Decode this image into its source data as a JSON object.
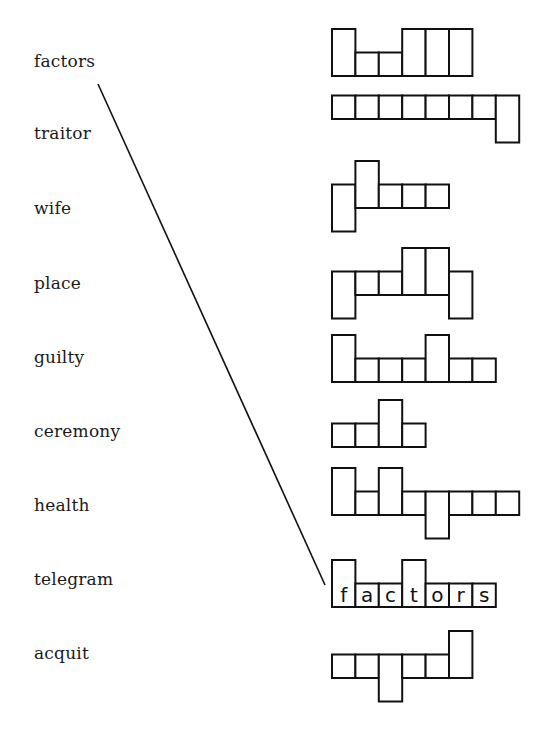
{
  "worksheet": {
    "words": [
      {
        "label": "factors",
        "y": 66
      },
      {
        "label": "traitor",
        "y": 138
      },
      {
        "label": "wife",
        "y": 213
      },
      {
        "label": "place",
        "y": 288
      },
      {
        "label": "guilty",
        "y": 362
      },
      {
        "label": "ceremony",
        "y": 436
      },
      {
        "label": "health",
        "y": 510
      },
      {
        "label": "telegram",
        "y": 584
      },
      {
        "label": "acquit",
        "y": 658
      }
    ],
    "cell_width": 23.4,
    "cell_height": 23.5,
    "shapes_x": 332,
    "shape_rows": [
      {
        "name": "shape-row-1",
        "baseline": 76,
        "cells": [
          "tall",
          "short",
          "short",
          "tall",
          "tall",
          "tall"
        ],
        "letters": []
      },
      {
        "name": "shape-row-2",
        "baseline": 119,
        "cells": [
          "short",
          "short",
          "short",
          "short",
          "short",
          "short",
          "short",
          "desc"
        ],
        "letters": []
      },
      {
        "name": "shape-row-3",
        "baseline": 208,
        "cells": [
          "desc",
          "tall",
          "short",
          "short",
          "short"
        ],
        "letters": []
      },
      {
        "name": "shape-row-4",
        "baseline": 295,
        "cells": [
          "desc",
          "short",
          "short",
          "tall",
          "tall",
          "desc"
        ],
        "letters": []
      },
      {
        "name": "shape-row-5",
        "baseline": 382,
        "cells": [
          "tall",
          "short",
          "short",
          "short",
          "tall",
          "short",
          "short"
        ],
        "letters": []
      },
      {
        "name": "shape-row-6",
        "baseline": 447,
        "cells": [
          "short",
          "short",
          "tall",
          "short"
        ],
        "letters": []
      },
      {
        "name": "shape-row-7",
        "baseline": 515,
        "cells": [
          "tall",
          "short",
          "tall",
          "short",
          "desc",
          "short",
          "short",
          "short"
        ],
        "letters": []
      },
      {
        "name": "shape-row-8-answered",
        "baseline": 607,
        "cells": [
          "tall",
          "short",
          "short",
          "tall",
          "short",
          "short",
          "short"
        ],
        "letters": [
          "f",
          "a",
          "c",
          "t",
          "o",
          "r",
          "s"
        ]
      },
      {
        "name": "shape-row-9",
        "baseline": 678,
        "cells": [
          "short",
          "short",
          "desc",
          "short",
          "short",
          "tall"
        ],
        "letters": []
      }
    ],
    "match_line": {
      "from_word": "factors",
      "to_shape": "shape-row-8-answered",
      "x1": 98,
      "y1": 84,
      "x2": 325,
      "y2": 585
    }
  }
}
